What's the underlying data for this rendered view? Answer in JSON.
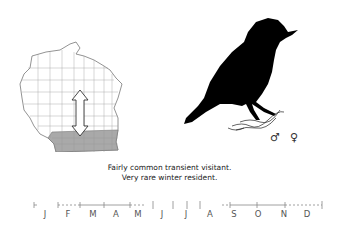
{
  "map": {
    "region": "Wisconsin",
    "shaded_region": "southern counties",
    "shade_color": "#a9a9a9",
    "arrow": "double-headed vertical arrow"
  },
  "illustration": {
    "subject": "bird silhouette",
    "color": "#000000"
  },
  "sex_symbols": {
    "male": "♂",
    "female": "♀"
  },
  "caption": {
    "line1": "Fairly common transient visitant.",
    "line2": "Very rare winter resident."
  },
  "timeline": {
    "months": [
      "J",
      "F",
      "M",
      "A",
      "M",
      "J",
      "J",
      "A",
      "S",
      "O",
      "N",
      "D"
    ],
    "line_color": "#888888"
  }
}
